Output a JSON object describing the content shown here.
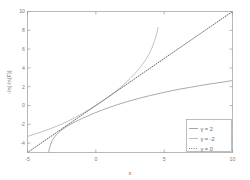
{
  "chart_data": {
    "type": "line",
    "title": "",
    "xlabel": "x",
    "ylabel": "-ln(-ln(F))",
    "xlim": [
      -5,
      10
    ],
    "ylim": [
      -5,
      10
    ],
    "xticks": [
      -5,
      0,
      5,
      10
    ],
    "yticks": [
      -4,
      -2,
      0,
      2,
      4,
      6,
      8,
      10
    ],
    "xtick_labels": [
      "-5",
      "0",
      "5",
      "10"
    ],
    "ytick_labels": [
      "-4",
      "-2",
      "0",
      "2",
      "4",
      "6",
      "8",
      "10"
    ],
    "grid": false,
    "legend_position": "lower-right",
    "series": [
      {
        "name": "gamma-2",
        "label": "γ = 2",
        "color": "#9b9b9b",
        "linestyle": "solid",
        "x": [
          -3.45,
          -3.4,
          -3.3,
          -3.2,
          -3.0,
          -2.8,
          -2.6,
          -2.4,
          -2.2,
          -2.0,
          -1.75,
          -1.5,
          -1.25,
          -1.0,
          -0.75,
          -0.5,
          -0.25,
          0.0,
          0.5,
          1.0,
          1.5,
          2.0,
          2.5,
          3.0,
          3.5,
          4.0,
          5.0,
          6.0,
          7.0,
          8.0,
          9.0,
          10.0
        ],
        "y": [
          -5.0,
          -4.6,
          -4.1,
          -3.75,
          -3.3,
          -2.98,
          -2.72,
          -2.5,
          -2.3,
          -2.12,
          -1.92,
          -1.73,
          -1.55,
          -1.38,
          -1.22,
          -1.06,
          -0.9,
          -0.75,
          -0.46,
          -0.2,
          0.05,
          0.28,
          0.5,
          0.7,
          0.89,
          1.07,
          1.4,
          1.7,
          1.96,
          2.21,
          2.43,
          2.65
        ]
      },
      {
        "name": "gamma-minus-2",
        "label": "γ = -2",
        "color": "#b5b5b5",
        "linestyle": "solid",
        "x": [
          -5.0,
          -4.5,
          -4.0,
          -3.5,
          -3.0,
          -2.5,
          -2.0,
          -1.5,
          -1.0,
          -0.5,
          0.0,
          0.5,
          1.0,
          1.5,
          2.0,
          2.5,
          3.0,
          3.3,
          3.6,
          3.9,
          4.1,
          4.3,
          4.45,
          4.55
        ],
        "y": [
          -3.3,
          -3.05,
          -2.82,
          -2.56,
          -2.28,
          -1.98,
          -1.64,
          -1.27,
          -0.86,
          -0.44,
          0.0,
          0.48,
          0.99,
          1.55,
          2.17,
          2.85,
          3.62,
          4.15,
          4.76,
          5.5,
          6.1,
          6.9,
          7.6,
          8.3
        ]
      },
      {
        "name": "gamma-0",
        "label": "γ = 0",
        "color": "#5a5a5a",
        "linestyle": "dotted",
        "x": [
          -5,
          10
        ],
        "y": [
          -5,
          10
        ]
      }
    ],
    "legend": [
      {
        "label": "γ = 2",
        "color": "#9b9b9b",
        "linestyle": "solid"
      },
      {
        "label": "γ = -2",
        "color": "#b5b5b5",
        "linestyle": "solid"
      },
      {
        "label": "γ = 0",
        "color": "#5a5a5a",
        "linestyle": "dotted"
      }
    ]
  }
}
